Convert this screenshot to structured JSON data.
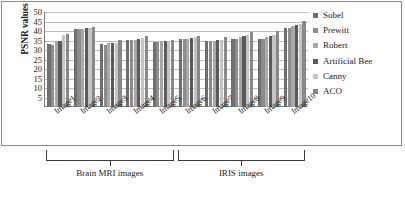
{
  "chart_data": {
    "type": "bar",
    "title": "",
    "subtitle": "",
    "xlabel": "",
    "ylabel": "PSNR values",
    "ylim": [
      0,
      50
    ],
    "yticks": [
      5,
      10,
      15,
      20,
      25,
      30,
      35,
      40,
      45,
      50
    ],
    "grid": true,
    "legend_position": "right",
    "categories": [
      "Image1",
      "Image2",
      "Image3",
      "Image4",
      "Image5",
      "Image6",
      "Image7",
      "Image8",
      "Image9",
      "Image10"
    ],
    "series": [
      {
        "name": "Sobel",
        "color": "#6e6e6e",
        "values": [
          33.0,
          40.8,
          33.0,
          35.3,
          34.2,
          35.7,
          34.6,
          35.6,
          35.9,
          41.4
        ]
      },
      {
        "name": "Prewitt",
        "color": "#8c8c8c",
        "values": [
          32.7,
          41.0,
          32.9,
          35.2,
          34.3,
          35.9,
          34.6,
          35.8,
          35.9,
          41.6
        ]
      },
      {
        "name": "Robert",
        "color": "#a8a8a8",
        "values": [
          34.8,
          41.3,
          33.5,
          35.4,
          34.5,
          36.0,
          34.9,
          36.8,
          36.9,
          42.6
        ]
      },
      {
        "name": "Artificial Bee",
        "color": "#5a5a5a",
        "values": [
          35.0,
          41.5,
          33.7,
          35.8,
          34.8,
          36.4,
          35.2,
          37.3,
          37.5,
          43.3
        ]
      },
      {
        "name": "Canny",
        "color": "#c4c4c4",
        "values": [
          37.9,
          41.7,
          33.9,
          36.2,
          35.0,
          36.9,
          35.5,
          38.0,
          37.9,
          43.6
        ]
      },
      {
        "name": "ACO",
        "color": "#898989",
        "values": [
          38.2,
          42.3,
          35.4,
          37.5,
          35.2,
          37.2,
          36.8,
          39.7,
          39.9,
          45.3
        ]
      }
    ],
    "group_annotations": [
      {
        "label": "Brain MRI images",
        "categories": [
          "Image1",
          "Image2",
          "Image3",
          "Image4",
          "Image5"
        ]
      },
      {
        "label": "IRIS images",
        "categories": [
          "Image6",
          "Image7",
          "Image8",
          "Image9",
          "Image10"
        ]
      }
    ]
  },
  "legend": {
    "items": [
      {
        "label": "Sobel"
      },
      {
        "label": "Prewitt"
      },
      {
        "label": "Robert"
      },
      {
        "label": "Artificial Bee"
      },
      {
        "label": "Canny"
      },
      {
        "label": "ACO"
      }
    ]
  },
  "axis": {
    "y_title": "PSNR values"
  }
}
